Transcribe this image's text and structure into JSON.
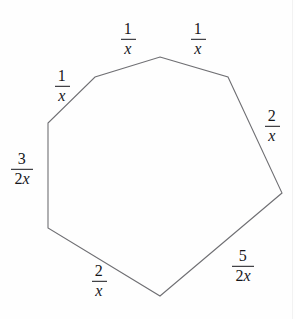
{
  "figure": {
    "shape": "heptagon",
    "stroke_color": "#6f6f73",
    "background_color": "#fefefe",
    "text_color": "#16161a",
    "vertices": [
      {
        "name": "top-apex",
        "x": 160,
        "y": 57
      },
      {
        "name": "upper-right-shoulder",
        "x": 228,
        "y": 77
      },
      {
        "name": "far-right",
        "x": 282,
        "y": 193
      },
      {
        "name": "bottom-apex",
        "x": 160,
        "y": 296
      },
      {
        "name": "lower-left",
        "x": 48,
        "y": 228
      },
      {
        "name": "upper-left",
        "x": 48,
        "y": 123
      },
      {
        "name": "upper-left-shoulder",
        "x": 95,
        "y": 77
      }
    ],
    "labels": [
      {
        "id": "side-top-left",
        "numerator": "1",
        "denominator": "x",
        "denominator_parts": [
          {
            "text": "x",
            "style": "italic"
          }
        ],
        "text": "1/x",
        "x": 128,
        "y": 39
      },
      {
        "id": "side-top-right",
        "numerator": "1",
        "denominator": "x",
        "denominator_parts": [
          {
            "text": "x",
            "style": "italic"
          }
        ],
        "text": "1/x",
        "x": 198,
        "y": 39
      },
      {
        "id": "side-upper-left",
        "numerator": "1",
        "denominator": "x",
        "denominator_parts": [
          {
            "text": "x",
            "style": "italic"
          }
        ],
        "text": "1/x",
        "x": 62,
        "y": 86
      },
      {
        "id": "side-left",
        "numerator": "3",
        "denominator": "2x",
        "denominator_parts": [
          {
            "text": "2",
            "style": "upright"
          },
          {
            "text": "x",
            "style": "italic"
          }
        ],
        "text": "3/2x",
        "x": 22,
        "y": 169
      },
      {
        "id": "side-upper-right",
        "numerator": "2",
        "denominator": "x",
        "denominator_parts": [
          {
            "text": "x",
            "style": "italic"
          }
        ],
        "text": "2/x",
        "x": 272,
        "y": 126
      },
      {
        "id": "side-lower-right",
        "numerator": "5",
        "denominator": "2x",
        "denominator_parts": [
          {
            "text": "2",
            "style": "upright"
          },
          {
            "text": "x",
            "style": "italic"
          }
        ],
        "text": "5/2x",
        "x": 243,
        "y": 266
      },
      {
        "id": "side-bottom",
        "numerator": "2",
        "denominator": "x",
        "denominator_parts": [
          {
            "text": "x",
            "style": "italic"
          }
        ],
        "text": "2/x",
        "x": 99,
        "y": 281
      }
    ]
  }
}
